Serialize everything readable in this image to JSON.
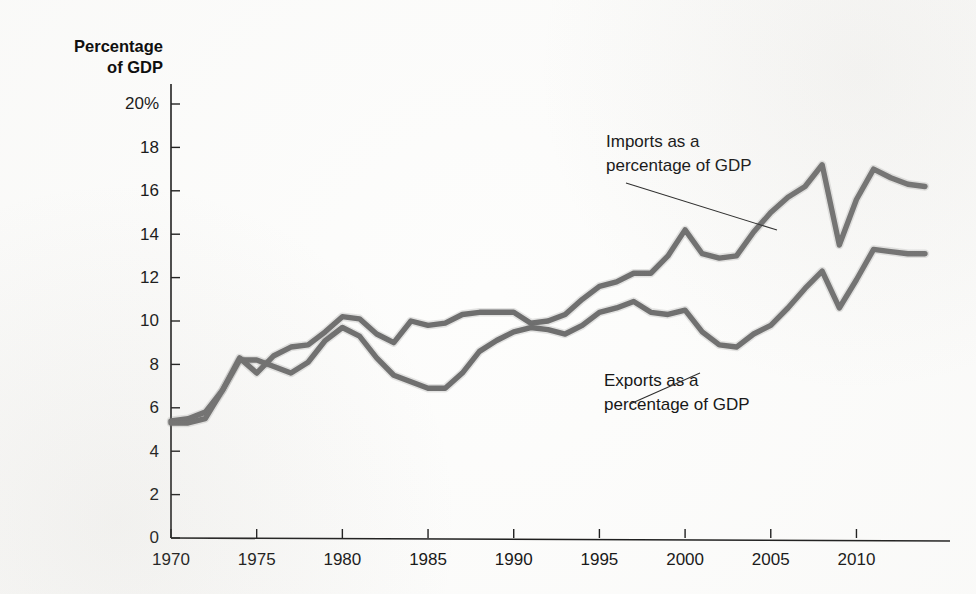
{
  "figure": {
    "axis_title_lines": [
      "Percentage",
      "of GDP"
    ],
    "line_color": "#6e6e6e",
    "axis_color": "#1a1a1a",
    "background_color": "#fdfdfc"
  },
  "annotations": [
    {
      "id": "imports-annotation",
      "lines": [
        "Imports as a",
        "percentage of GDP"
      ],
      "text_x": 606,
      "text_y": 147,
      "leader": {
        "x1": 626,
        "y1": 183,
        "x2": 777,
        "y2": 230
      }
    },
    {
      "id": "exports-annotation",
      "lines": [
        "Exports as a",
        "percentage of GDP"
      ],
      "text_x": 604,
      "text_y": 386,
      "leader": {
        "x1": 700,
        "y1": 373,
        "x2": 630,
        "y2": 404
      }
    }
  ],
  "chart_data": {
    "type": "line",
    "title": "",
    "subtitle": "",
    "xlabel": "",
    "ylabel": "Percentage of GDP",
    "xlim": [
      1970,
      2014
    ],
    "ylim": [
      0,
      20
    ],
    "grid": false,
    "legend_position": "inline-annotation",
    "y_ticks": [
      0,
      2,
      4,
      6,
      8,
      10,
      12,
      14,
      16,
      18,
      20
    ],
    "y_tick_labels": [
      "0",
      "2",
      "4",
      "6",
      "8",
      "10",
      "12",
      "14",
      "16",
      "18",
      "20%"
    ],
    "x_ticks": [
      1970,
      1975,
      1980,
      1985,
      1990,
      1995,
      2000,
      2005,
      2010
    ],
    "x_tick_labels": [
      "1970",
      "1975",
      "1980",
      "1985",
      "1990",
      "1995",
      "2000",
      "2005",
      "2010"
    ],
    "x": [
      1970,
      1971,
      1972,
      1973,
      1974,
      1975,
      1976,
      1977,
      1978,
      1979,
      1980,
      1981,
      1982,
      1983,
      1984,
      1985,
      1986,
      1987,
      1988,
      1989,
      1990,
      1991,
      1992,
      1993,
      1994,
      1995,
      1996,
      1997,
      1998,
      1999,
      2000,
      2001,
      2002,
      2003,
      2004,
      2005,
      2006,
      2007,
      2008,
      2009,
      2010,
      2011,
      2012,
      2013,
      2014
    ],
    "series": [
      {
        "name": "Imports as a percentage of GDP",
        "color": "#6e6e6e",
        "values": [
          5.4,
          5.5,
          5.8,
          6.8,
          8.3,
          7.6,
          8.4,
          8.8,
          8.9,
          9.5,
          10.2,
          10.1,
          9.4,
          9.0,
          10.0,
          9.8,
          9.9,
          10.3,
          10.4,
          10.4,
          10.4,
          9.9,
          10.0,
          10.3,
          11.0,
          11.6,
          11.8,
          12.2,
          12.2,
          13.0,
          14.2,
          13.1,
          12.9,
          13.0,
          14.1,
          15.0,
          15.7,
          16.2,
          17.2,
          13.5,
          15.6,
          17.0,
          16.6,
          16.3,
          16.2
        ]
      },
      {
        "name": "Exports as a percentage of GDP",
        "color": "#6e6e6e",
        "values": [
          5.3,
          5.3,
          5.5,
          6.8,
          8.2,
          8.2,
          7.9,
          7.6,
          8.1,
          9.1,
          9.7,
          9.3,
          8.3,
          7.5,
          7.2,
          6.9,
          6.9,
          7.6,
          8.6,
          9.1,
          9.5,
          9.7,
          9.6,
          9.4,
          9.8,
          10.4,
          10.6,
          10.9,
          10.4,
          10.3,
          10.5,
          9.5,
          8.9,
          8.8,
          9.4,
          9.8,
          10.6,
          11.5,
          12.3,
          10.6,
          11.9,
          13.3,
          13.2,
          13.1,
          13.1
        ]
      }
    ]
  }
}
